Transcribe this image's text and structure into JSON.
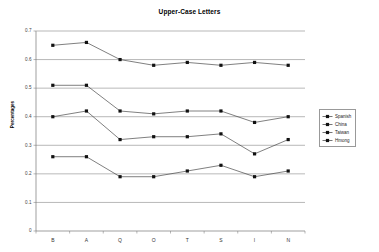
{
  "chart_data": {
    "type": "line",
    "title": "Upper-Case Letters",
    "xlabel": "",
    "ylabel": "Percentages",
    "categories": [
      "B",
      "A",
      "Q",
      "O",
      "T",
      "S",
      "I",
      "N"
    ],
    "ylim": [
      0,
      0.7
    ],
    "ytick_labels": [
      "0",
      "0.1",
      "0.2",
      "0.3",
      "0.4",
      "0.5",
      "0.6",
      "0.7"
    ],
    "ytick_values": [
      0,
      0.1,
      0.2,
      0.3,
      0.4,
      0.5,
      0.6,
      0.7
    ],
    "grid": true,
    "legend_position": "right",
    "series": [
      {
        "name": "Spanish",
        "values": [
          0.26,
          0.26,
          0.19,
          0.19,
          0.21,
          0.23,
          0.19,
          0.21
        ]
      },
      {
        "name": "China",
        "values": [
          0.4,
          0.42,
          0.32,
          0.33,
          0.33,
          0.34,
          0.27,
          0.32
        ]
      },
      {
        "name": "Taiwan",
        "values": [
          0.51,
          0.51,
          0.42,
          0.41,
          0.42,
          0.42,
          0.38,
          0.4
        ]
      },
      {
        "name": "Hmong",
        "values": [
          0.65,
          0.66,
          0.6,
          0.58,
          0.59,
          0.58,
          0.59,
          0.58
        ]
      }
    ]
  },
  "legend": {
    "items": [
      {
        "label": "Spanish"
      },
      {
        "label": "China"
      },
      {
        "label": "Taiwan"
      },
      {
        "label": "Hmong"
      }
    ]
  },
  "colors": {
    "series_line": "#3a3a3a",
    "marker": "#111111",
    "gridline": "#888888",
    "background": "#ffffff"
  }
}
